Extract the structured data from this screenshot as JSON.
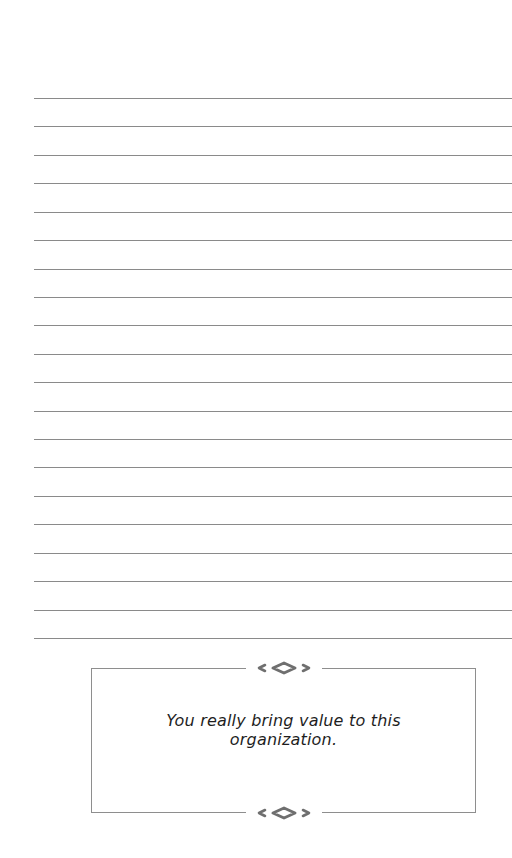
{
  "page": {
    "type": "lined-note-page",
    "ruled_line_count": 20,
    "ruled_line_color": "#8a8a8a",
    "background": "#ffffff"
  },
  "quote": {
    "line1": "You really bring value to this",
    "line2": "organization.",
    "text_color": "#1e1e1e",
    "border_color": "#8e8e8e"
  },
  "icons": {
    "ornament_top": "diamond-flourish-icon",
    "ornament_bottom": "diamond-flourish-icon"
  }
}
